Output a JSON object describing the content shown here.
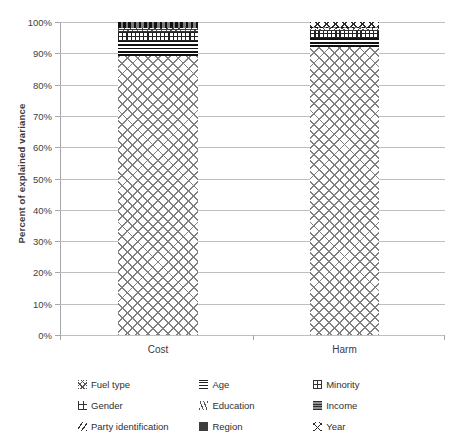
{
  "chart_data": {
    "type": "bar",
    "stacked": true,
    "title": "",
    "xlabel": "",
    "ylabel": "Percent of explained variance",
    "categories": [
      "Cost",
      "Harm"
    ],
    "ylim": [
      0,
      100
    ],
    "ytick_labels": [
      "0%",
      "10%",
      "20%",
      "30%",
      "40%",
      "50%",
      "60%",
      "70%",
      "80%",
      "90%",
      "100%"
    ],
    "ytick_values": [
      0,
      10,
      20,
      30,
      40,
      50,
      60,
      70,
      80,
      90,
      100
    ],
    "grid": true,
    "legend_position": "bottom",
    "series": [
      {
        "name": "Fuel type",
        "pattern": "crosshatch-diagonal-grey",
        "values": [
          89.0,
          92.0
        ]
      },
      {
        "name": "Age",
        "pattern": "horizontal-lines",
        "values": [
          5.0,
          3.0
        ]
      },
      {
        "name": "Minority",
        "pattern": "fine-dots",
        "values": [
          3.0,
          2.5
        ]
      },
      {
        "name": "Gender",
        "pattern": "sparse-dots",
        "values": [
          0.3,
          0.2
        ]
      },
      {
        "name": "Education",
        "pattern": "wavy-hatch",
        "values": [
          0.3,
          0.2
        ]
      },
      {
        "name": "Income",
        "pattern": "grey-solid-lines",
        "values": [
          0.3,
          0.2
        ]
      },
      {
        "name": "Party identification",
        "pattern": "backslash-hatch",
        "values": [
          0.3,
          0.2
        ]
      },
      {
        "name": "Region",
        "pattern": "dark-blocks",
        "values": [
          1.8,
          0.2
        ]
      },
      {
        "name": "Year",
        "pattern": "diamond-net",
        "values": [
          0.0,
          1.5
        ]
      }
    ]
  },
  "axes": {
    "y_title": "Percent of explained variance"
  },
  "legend": {
    "items": [
      {
        "label": "Fuel type",
        "swatch": "sw-fuel",
        "icon_name": "legend-swatch-fuel-type"
      },
      {
        "label": "Age",
        "swatch": "sw-age",
        "icon_name": "legend-swatch-age"
      },
      {
        "label": "Minority",
        "swatch": "sw-minority",
        "icon_name": "legend-swatch-minority"
      },
      {
        "label": "Gender",
        "swatch": "sw-gender",
        "icon_name": "legend-swatch-gender"
      },
      {
        "label": "Education",
        "swatch": "sw-education",
        "icon_name": "legend-swatch-education"
      },
      {
        "label": "Income",
        "swatch": "sw-income",
        "icon_name": "legend-swatch-income"
      },
      {
        "label": "Party identification",
        "swatch": "sw-party",
        "icon_name": "legend-swatch-party-identification"
      },
      {
        "label": "Region",
        "swatch": "sw-region",
        "icon_name": "legend-swatch-region"
      },
      {
        "label": "Year",
        "swatch": "sw-year",
        "icon_name": "legend-swatch-year"
      }
    ]
  },
  "style": {
    "gridline_color": "#bfbfbf",
    "axis_color": "#a6a6a6",
    "text_color": "#2f2f2f",
    "background": "#ffffff"
  }
}
